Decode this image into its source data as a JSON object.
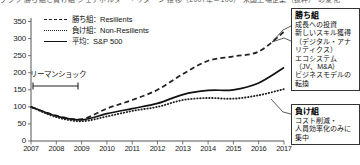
{
  "header": {
    "clipped_title": "グラフ 勝ち組と負け組 シェアホルダー・リターン 推移（2007年＝100） 米国上場企業（抜粋） の変化"
  },
  "legend": {
    "position": "top-left",
    "items": [
      {
        "label": "勝ち組：Resilients",
        "style": "dashed",
        "color": "#222222"
      },
      {
        "label": "負け組：Non-Resilients",
        "style": "dotted",
        "color": "#222222"
      },
      {
        "label": "平均：S&P 500",
        "style": "solid",
        "color": "#111111"
      }
    ]
  },
  "annotations": {
    "lehman": {
      "label": "リーマンショック",
      "start_year": 2008,
      "end_year": 2009
    }
  },
  "callouts": [
    {
      "id": "win",
      "title": "勝ち組",
      "body": "成長への投資\n新しいスキル獲得\n（デジタル・アナリティクス）\nエコシステム\n（JV、M&A）\nビジネスモデルの転換"
    },
    {
      "id": "lose",
      "title": "負け組",
      "body": "コスト削減・\n人員効率化のみに\n集中"
    }
  ],
  "chart_data": {
    "type": "line",
    "title": "",
    "xlabel": "",
    "ylabel": "",
    "xlim": [
      2007,
      2017
    ],
    "ylim": [
      0,
      350
    ],
    "yticks": [
      0,
      50,
      100,
      150,
      200,
      250,
      300,
      350
    ],
    "categories": [
      2007,
      2008,
      2009,
      2010,
      2011,
      2012,
      2013,
      2014,
      2015,
      2016,
      2017
    ],
    "grid": false,
    "legend_position": "top-left",
    "series": [
      {
        "name": "勝ち組：Resilients",
        "style": "dashed",
        "color": "#222222",
        "values": [
          100,
          74,
          64,
          95,
          120,
          150,
          196,
          235,
          248,
          262,
          320
        ]
      },
      {
        "name": "平均：S&P 500",
        "style": "solid",
        "color": "#111111",
        "values": [
          100,
          73,
          62,
          80,
          95,
          110,
          136,
          148,
          150,
          170,
          215
        ]
      },
      {
        "name": "負け組：Non-Resilients",
        "style": "dotted",
        "color": "#222222",
        "values": [
          100,
          70,
          58,
          72,
          88,
          100,
          120,
          126,
          124,
          134,
          152
        ]
      }
    ]
  }
}
